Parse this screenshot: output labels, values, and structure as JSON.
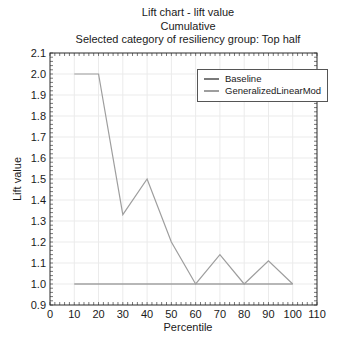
{
  "background": "#ffffff",
  "chart_data": {
    "type": "line",
    "title": "Lift chart - lift value",
    "subtitle": "Cumulative",
    "subtitle2": "Selected category of resiliency group: Top half",
    "xlabel": "Percentile",
    "ylabel": "Lift value",
    "xlim": [
      0,
      110
    ],
    "ylim": [
      0.9,
      2.1
    ],
    "x_ticks": [
      0,
      10,
      20,
      30,
      40,
      50,
      60,
      70,
      80,
      90,
      100,
      110
    ],
    "y_ticks": [
      0.9,
      1.0,
      1.1,
      1.2,
      1.3,
      1.4,
      1.5,
      1.6,
      1.7,
      1.8,
      1.9,
      2.0,
      2.1
    ],
    "x_minor_step": 2,
    "y_minor_step": 0.02,
    "grid": true,
    "grid_color": "#ebebeb",
    "frame_color": "#2a2a2a",
    "minor_tick_color": "#555555",
    "legend_position": "upper-right-inside",
    "x": [
      10,
      20,
      30,
      40,
      50,
      60,
      70,
      80,
      90,
      100
    ],
    "series": [
      {
        "name": "Baseline",
        "color": "#7a7a7a",
        "values": [
          1.0,
          1.0,
          1.0,
          1.0,
          1.0,
          1.0,
          1.0,
          1.0,
          1.0,
          1.0
        ]
      },
      {
        "name": "GeneralizedLinearMod",
        "color": "#9e9e9e",
        "values": [
          2.0,
          2.0,
          1.33,
          1.5,
          1.2,
          1.0,
          1.14,
          1.0,
          1.11,
          1.0
        ]
      }
    ]
  }
}
